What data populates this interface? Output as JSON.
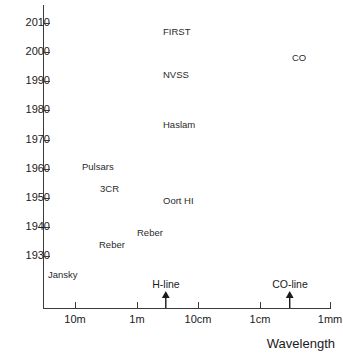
{
  "chart_data": {
    "type": "scatter",
    "title": "",
    "xlabel": "Wavelength",
    "ylabel": "",
    "xscale": "log-wavelength-decreasing",
    "grid": false,
    "legend": null,
    "ylim": [
      1925,
      2013
    ],
    "yticks": [
      1930,
      1940,
      1950,
      1960,
      1970,
      1980,
      1990,
      2000,
      2010
    ],
    "ytick_labels": [
      "1930",
      "1940",
      "1950",
      "1960",
      "1970",
      "1980",
      "1990",
      "2000",
      "2010"
    ],
    "xticks": [
      "10m",
      "1m",
      "10cm",
      "1cm",
      "1mm"
    ],
    "xtick_labels": [
      "10m",
      "1m",
      "10cm",
      "1cm",
      "1mm"
    ],
    "points": [
      {
        "label": "Jansky",
        "year": 1931,
        "wavelength": "14m",
        "x_px": 48,
        "y_px": 270
      },
      {
        "label": "Reber",
        "year": 1942,
        "wavelength": "2m",
        "x_px": 99,
        "y_px": 240
      },
      {
        "label": "Reber",
        "year": 1946,
        "wavelength": "60cm",
        "x_px": 137,
        "y_px": 228
      },
      {
        "label": "3CR",
        "year": 1960,
        "wavelength": "3.7m",
        "x_px": 100,
        "y_px": 184
      },
      {
        "label": "Pulsars",
        "year": 1967,
        "wavelength": "8m",
        "x_px": 82,
        "y_px": 162
      },
      {
        "label": "Oort HI",
        "year": 1956,
        "wavelength": "21cm",
        "x_px": 163,
        "y_px": 196
      },
      {
        "label": "Haslam",
        "year": 1981,
        "wavelength": "73cm",
        "x_px": 163,
        "y_px": 120
      },
      {
        "label": "NVSS",
        "year": 1997,
        "wavelength": "21cm",
        "x_px": 163,
        "y_px": 70
      },
      {
        "label": "FIRST",
        "year": 2008,
        "wavelength": "21cm",
        "x_px": 163,
        "y_px": 27
      },
      {
        "label": "CO",
        "year": 2001,
        "wavelength": "2.6mm",
        "x_px": 292,
        "y_px": 53
      }
    ],
    "annotations": [
      {
        "label": "H-line",
        "x_px": 166,
        "wavelength": "21cm",
        "arrow": "up"
      },
      {
        "label": "CO-line",
        "x_px": 290,
        "wavelength": "2.6mm",
        "arrow": "up"
      }
    ],
    "xtick_positions_px": [
      75,
      137,
      198,
      260,
      330
    ],
    "ytick_positions_px": [
      256,
      227,
      198,
      169,
      140,
      110,
      81,
      52,
      23
    ],
    "axis_color": "#3a3a3a",
    "text_color": "#1a1a1a"
  }
}
